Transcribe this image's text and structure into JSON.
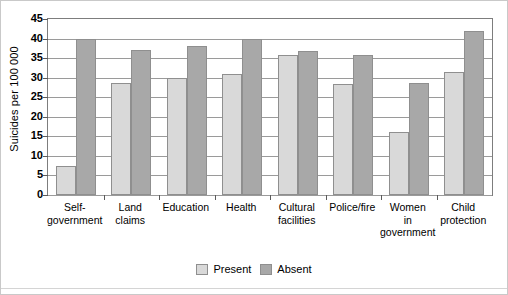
{
  "chart_data": {
    "type": "bar",
    "title": "",
    "xlabel": "",
    "ylabel": "Suicides per 100 000",
    "ylim": [
      0,
      45
    ],
    "ytick_step": 5,
    "yticks": [
      0,
      5,
      10,
      15,
      20,
      25,
      30,
      35,
      40,
      45
    ],
    "grid": true,
    "legend_position": "bottom-center",
    "categories": [
      "Self-government",
      "Land claims",
      "Education",
      "Health",
      "Cultural facilities",
      "Police/fire",
      "Women in government",
      "Child protection"
    ],
    "category_lines": [
      [
        "Self-",
        "government"
      ],
      [
        "Land",
        "claims"
      ],
      [
        "Education"
      ],
      [
        "Health"
      ],
      [
        "Cultural",
        "facilities"
      ],
      [
        "Police/fire"
      ],
      [
        "Women",
        "in",
        "government"
      ],
      [
        "Child",
        "protection"
      ]
    ],
    "series": [
      {
        "name": "Present",
        "color": "#d9d9d9",
        "values": [
          7.5,
          28.7,
          30.0,
          31.0,
          35.7,
          28.5,
          16.0,
          31.5
        ]
      },
      {
        "name": "Absent",
        "color": "#a8a8a8",
        "values": [
          40.0,
          37.0,
          38.0,
          40.0,
          36.8,
          35.7,
          28.6,
          42.0
        ]
      }
    ]
  },
  "axis": {
    "y_title": "Suicides per 100 000"
  },
  "legend": {
    "items": [
      {
        "label": "Present"
      },
      {
        "label": "Absent"
      }
    ]
  },
  "colors": {
    "present": "#d9d9d9",
    "absent": "#a8a8a8",
    "frame": "#7d7d7d",
    "gridline": "#9a9a9a",
    "background": "#ffffff"
  }
}
